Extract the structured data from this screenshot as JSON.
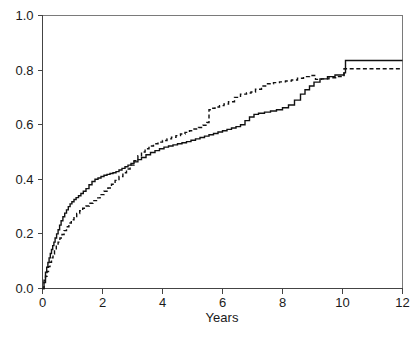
{
  "figure": {
    "width": 419,
    "height": 340,
    "background": "#ffffff",
    "ink_color": "#111111",
    "axis_color": "#444444",
    "frame_color": "#7a7a7a"
  },
  "chart_data": {
    "type": "line",
    "title": "",
    "subtitle": "",
    "xlabel": "Years",
    "ylabel": "",
    "xlim": [
      0,
      12
    ],
    "ylim": [
      0,
      1
    ],
    "grid": false,
    "legend": null,
    "legend_position": "none",
    "xticks": [
      0,
      2,
      4,
      6,
      8,
      10,
      12
    ],
    "xtick_labels": [
      "0",
      "2",
      "4",
      "6",
      "8",
      "10",
      "12"
    ],
    "yticks": [
      0.0,
      0.2,
      0.4,
      0.6,
      0.8,
      1.0
    ],
    "ytick_labels": [
      "0.0",
      "0.2",
      "0.4",
      "0.6",
      "0.8",
      "1.0"
    ],
    "annotations": [],
    "series": [
      {
        "name": "solid-curve",
        "style": "solid",
        "color": "#111111",
        "step": "post",
        "x": [
          0.0,
          0.05,
          0.1,
          0.14,
          0.18,
          0.22,
          0.26,
          0.3,
          0.34,
          0.38,
          0.42,
          0.47,
          0.52,
          0.57,
          0.62,
          0.68,
          0.74,
          0.8,
          0.86,
          0.92,
          0.98,
          1.05,
          1.12,
          1.2,
          1.28,
          1.36,
          1.45,
          1.55,
          1.65,
          1.75,
          1.85,
          1.95,
          2.05,
          2.15,
          2.25,
          2.35,
          2.45,
          2.55,
          2.65,
          2.75,
          2.85,
          2.95,
          3.05,
          3.18,
          3.3,
          3.45,
          3.6,
          3.75,
          3.9,
          4.05,
          4.2,
          4.35,
          4.5,
          4.65,
          4.8,
          4.95,
          5.1,
          5.25,
          5.4,
          5.55,
          5.7,
          5.85,
          6.0,
          6.15,
          6.3,
          6.45,
          6.6,
          6.75,
          6.9,
          7.05,
          7.2,
          7.4,
          7.6,
          7.8,
          8.0,
          8.2,
          8.4,
          8.6,
          8.75,
          8.9,
          9.05,
          9.25,
          9.5,
          9.75,
          10.05,
          10.1,
          12.0
        ],
        "y": [
          0.0,
          0.03,
          0.06,
          0.078,
          0.095,
          0.112,
          0.128,
          0.143,
          0.157,
          0.17,
          0.185,
          0.2,
          0.215,
          0.232,
          0.248,
          0.263,
          0.276,
          0.288,
          0.3,
          0.31,
          0.318,
          0.326,
          0.333,
          0.34,
          0.348,
          0.356,
          0.366,
          0.38,
          0.392,
          0.4,
          0.405,
          0.41,
          0.415,
          0.418,
          0.421,
          0.424,
          0.428,
          0.434,
          0.44,
          0.446,
          0.452,
          0.458,
          0.464,
          0.472,
          0.48,
          0.49,
          0.498,
          0.505,
          0.512,
          0.518,
          0.522,
          0.526,
          0.53,
          0.534,
          0.538,
          0.543,
          0.548,
          0.553,
          0.558,
          0.563,
          0.568,
          0.573,
          0.578,
          0.583,
          0.588,
          0.593,
          0.6,
          0.615,
          0.628,
          0.638,
          0.642,
          0.646,
          0.65,
          0.655,
          0.662,
          0.672,
          0.69,
          0.712,
          0.728,
          0.742,
          0.756,
          0.768,
          0.776,
          0.782,
          0.79,
          0.835,
          0.835
        ]
      },
      {
        "name": "dashed-curve",
        "style": "dashed",
        "color": "#111111",
        "step": "post",
        "x": [
          0.0,
          0.05,
          0.1,
          0.15,
          0.2,
          0.25,
          0.3,
          0.35,
          0.4,
          0.46,
          0.52,
          0.58,
          0.65,
          0.72,
          0.8,
          0.88,
          0.96,
          1.05,
          1.14,
          1.24,
          1.34,
          1.45,
          1.56,
          1.68,
          1.8,
          1.92,
          2.05,
          2.18,
          2.3,
          2.42,
          2.55,
          2.68,
          2.8,
          2.92,
          3.05,
          3.18,
          3.3,
          3.42,
          3.55,
          3.7,
          3.85,
          4.0,
          4.15,
          4.3,
          4.45,
          4.6,
          4.75,
          4.9,
          5.05,
          5.2,
          5.35,
          5.48,
          5.55,
          5.62,
          5.75,
          5.9,
          6.05,
          6.2,
          6.4,
          6.6,
          6.8,
          6.95,
          7.1,
          7.3,
          7.5,
          7.7,
          7.9,
          8.1,
          8.3,
          8.5,
          8.7,
          8.9,
          9.1,
          9.3,
          9.55,
          9.8,
          10.05,
          10.1,
          12.0
        ],
        "y": [
          0.0,
          0.022,
          0.045,
          0.062,
          0.08,
          0.096,
          0.112,
          0.126,
          0.14,
          0.155,
          0.17,
          0.185,
          0.198,
          0.212,
          0.226,
          0.24,
          0.252,
          0.264,
          0.275,
          0.285,
          0.294,
          0.302,
          0.312,
          0.322,
          0.332,
          0.344,
          0.356,
          0.368,
          0.382,
          0.396,
          0.41,
          0.424,
          0.438,
          0.452,
          0.468,
          0.486,
          0.5,
          0.512,
          0.522,
          0.53,
          0.536,
          0.542,
          0.548,
          0.554,
          0.56,
          0.566,
          0.572,
          0.578,
          0.584,
          0.59,
          0.598,
          0.608,
          0.655,
          0.66,
          0.665,
          0.67,
          0.676,
          0.684,
          0.7,
          0.712,
          0.716,
          0.72,
          0.73,
          0.742,
          0.75,
          0.754,
          0.757,
          0.76,
          0.764,
          0.77,
          0.776,
          0.78,
          0.766,
          0.768,
          0.772,
          0.776,
          0.805,
          0.805,
          0.805
        ]
      }
    ]
  }
}
